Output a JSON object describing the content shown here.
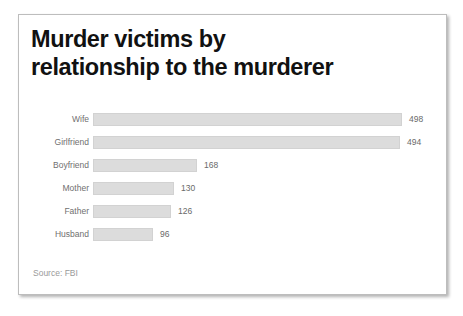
{
  "card": {
    "title_lines": [
      "Murder victims by",
      "relationship to the murderer"
    ],
    "source_note": "Source: FBI"
  },
  "colors": {
    "bar_fill": "#dcdcdc",
    "bar_border": "#d2d2d2",
    "title_text": "#111111",
    "label_text": "#6f6f6f",
    "value_text": "#6a6a6a",
    "source_text": "#9a9a9a",
    "card_border": "#bdbdbd",
    "background": "#ffffff"
  },
  "chart_data": {
    "type": "bar",
    "orientation": "horizontal",
    "title": "Murder victims by relationship to the murderer",
    "xlabel": "",
    "ylabel": "",
    "grid": false,
    "legend": null,
    "source": "Source: FBI",
    "xlim": [
      0,
      498
    ],
    "categories": [
      "Wife",
      "Girlfriend",
      "Boyfriend",
      "Mother",
      "Father",
      "Husband"
    ],
    "values": [
      498,
      494,
      168,
      130,
      126,
      96
    ],
    "value_labels": [
      "498",
      "494",
      "168",
      "130",
      "126",
      "96"
    ]
  }
}
